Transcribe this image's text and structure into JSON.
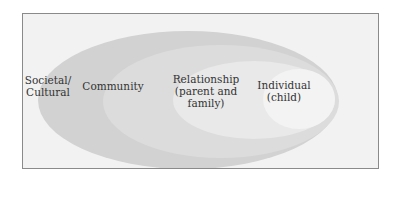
{
  "diagram": {
    "type": "nested-ellipses",
    "levels": [
      {
        "id": "societal",
        "label": "Societal/\nCultural",
        "color": "#d2d2d2"
      },
      {
        "id": "community",
        "label": "Community",
        "color": "#dcdcdc"
      },
      {
        "id": "relationship",
        "label": "Relationship\n(parent and\nfamily)",
        "color": "#e9e9e9"
      },
      {
        "id": "individual",
        "label": "Individual\n(child)",
        "color": "#f3f3f3"
      }
    ],
    "frame": {
      "border_color": "#8a8a8a",
      "background": "#f2f2f2"
    }
  }
}
